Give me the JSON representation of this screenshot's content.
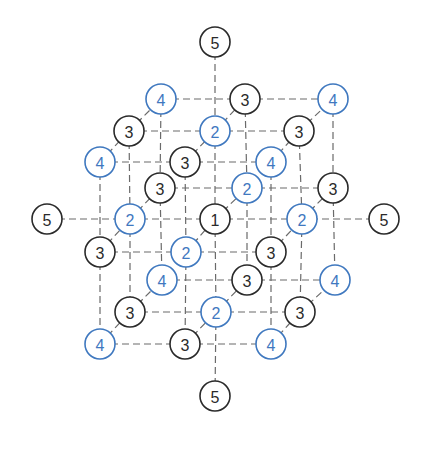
{
  "diagram": {
    "title": "",
    "colors": {
      "odd_shell": "#2a2a2a",
      "even_shell": "#3f78bf",
      "edge": "#6a6a6a",
      "background": "#ffffff"
    },
    "node_radius": 15,
    "nodes": [
      {
        "id": "top-5",
        "label": "5",
        "x": 215,
        "y": 42,
        "color": "odd"
      },
      {
        "id": "L2-r0-c0",
        "label": "4",
        "x": 161,
        "y": 99,
        "color": "even"
      },
      {
        "id": "L2-r0-c1",
        "label": "3",
        "x": 245,
        "y": 99,
        "color": "odd"
      },
      {
        "id": "L2-r0-c2",
        "label": "4",
        "x": 333,
        "y": 99,
        "color": "even"
      },
      {
        "id": "L1-r0-c0",
        "label": "3",
        "x": 129,
        "y": 131,
        "color": "odd"
      },
      {
        "id": "L1-r0-c1",
        "label": "2",
        "x": 215,
        "y": 131,
        "color": "even"
      },
      {
        "id": "L1-r0-c2",
        "label": "3",
        "x": 299,
        "y": 131,
        "color": "odd"
      },
      {
        "id": "L0-r0-c0",
        "label": "4",
        "x": 100,
        "y": 162,
        "color": "even"
      },
      {
        "id": "L0-r0-c1",
        "label": "3",
        "x": 185,
        "y": 162,
        "color": "odd"
      },
      {
        "id": "L0-r0-c2",
        "label": "4",
        "x": 271,
        "y": 162,
        "color": "even"
      },
      {
        "id": "L2-r1-c0",
        "label": "3",
        "x": 160,
        "y": 188,
        "color": "odd"
      },
      {
        "id": "L2-r1-c1",
        "label": "2",
        "x": 247,
        "y": 188,
        "color": "even"
      },
      {
        "id": "L2-r1-c2",
        "label": "3",
        "x": 333,
        "y": 188,
        "color": "odd"
      },
      {
        "id": "left-5",
        "label": "5",
        "x": 47,
        "y": 219,
        "color": "odd"
      },
      {
        "id": "L1-r1-c0",
        "label": "2",
        "x": 130,
        "y": 219,
        "color": "even"
      },
      {
        "id": "center-1",
        "label": "1",
        "x": 215,
        "y": 219,
        "color": "odd"
      },
      {
        "id": "L1-r1-c2",
        "label": "2",
        "x": 302,
        "y": 219,
        "color": "even"
      },
      {
        "id": "right-5",
        "label": "5",
        "x": 384,
        "y": 219,
        "color": "odd"
      },
      {
        "id": "L0-r1-c0",
        "label": "3",
        "x": 100,
        "y": 252,
        "color": "odd"
      },
      {
        "id": "L0-r1-c1",
        "label": "2",
        "x": 186,
        "y": 252,
        "color": "even"
      },
      {
        "id": "L0-r1-c2",
        "label": "3",
        "x": 271,
        "y": 252,
        "color": "odd"
      },
      {
        "id": "L2-r2-c0",
        "label": "4",
        "x": 162,
        "y": 280,
        "color": "even"
      },
      {
        "id": "L2-r2-c1",
        "label": "3",
        "x": 247,
        "y": 280,
        "color": "odd"
      },
      {
        "id": "L2-r2-c2",
        "label": "4",
        "x": 335,
        "y": 280,
        "color": "even"
      },
      {
        "id": "L1-r2-c0",
        "label": "3",
        "x": 130,
        "y": 312,
        "color": "odd"
      },
      {
        "id": "L1-r2-c1",
        "label": "2",
        "x": 216,
        "y": 312,
        "color": "even"
      },
      {
        "id": "L1-r2-c2",
        "label": "3",
        "x": 300,
        "y": 312,
        "color": "odd"
      },
      {
        "id": "L0-r2-c0",
        "label": "4",
        "x": 100,
        "y": 344,
        "color": "even"
      },
      {
        "id": "L0-r2-c1",
        "label": "3",
        "x": 185,
        "y": 344,
        "color": "odd"
      },
      {
        "id": "L0-r2-c2",
        "label": "4",
        "x": 271,
        "y": 344,
        "color": "even"
      },
      {
        "id": "bottom-5",
        "label": "5",
        "x": 215,
        "y": 396,
        "color": "odd"
      }
    ],
    "edges": [
      [
        "L2-r0-c0",
        "L2-r0-c1"
      ],
      [
        "L2-r0-c1",
        "L2-r0-c2"
      ],
      [
        "L2-r1-c0",
        "L2-r1-c1"
      ],
      [
        "L2-r1-c1",
        "L2-r1-c2"
      ],
      [
        "L2-r2-c0",
        "L2-r2-c1"
      ],
      [
        "L2-r2-c1",
        "L2-r2-c2"
      ],
      [
        "L1-r0-c0",
        "L1-r0-c1"
      ],
      [
        "L1-r0-c1",
        "L1-r0-c2"
      ],
      [
        "L1-r1-c0",
        "center-1"
      ],
      [
        "center-1",
        "L1-r1-c2"
      ],
      [
        "L1-r2-c0",
        "L1-r2-c1"
      ],
      [
        "L1-r2-c1",
        "L1-r2-c2"
      ],
      [
        "L0-r0-c0",
        "L0-r0-c1"
      ],
      [
        "L0-r0-c1",
        "L0-r0-c2"
      ],
      [
        "L0-r1-c0",
        "L0-r1-c1"
      ],
      [
        "L0-r1-c1",
        "L0-r1-c2"
      ],
      [
        "L0-r2-c0",
        "L0-r2-c1"
      ],
      [
        "L0-r2-c1",
        "L0-r2-c2"
      ],
      [
        "L2-r0-c0",
        "L2-r1-c0"
      ],
      [
        "L2-r1-c0",
        "L2-r2-c0"
      ],
      [
        "L2-r0-c1",
        "L2-r1-c1"
      ],
      [
        "L2-r1-c1",
        "L2-r2-c1"
      ],
      [
        "L2-r0-c2",
        "L2-r1-c2"
      ],
      [
        "L2-r1-c2",
        "L2-r2-c2"
      ],
      [
        "L1-r0-c0",
        "L1-r1-c0"
      ],
      [
        "L1-r1-c0",
        "L1-r2-c0"
      ],
      [
        "L1-r0-c1",
        "center-1"
      ],
      [
        "center-1",
        "L1-r2-c1"
      ],
      [
        "L1-r0-c2",
        "L1-r1-c2"
      ],
      [
        "L1-r1-c2",
        "L1-r2-c2"
      ],
      [
        "L0-r0-c0",
        "L0-r1-c0"
      ],
      [
        "L0-r1-c0",
        "L0-r2-c0"
      ],
      [
        "L0-r0-c1",
        "L0-r1-c1"
      ],
      [
        "L0-r1-c1",
        "L0-r2-c1"
      ],
      [
        "L0-r0-c2",
        "L0-r1-c2"
      ],
      [
        "L0-r1-c2",
        "L0-r2-c2"
      ],
      [
        "L0-r0-c0",
        "L1-r0-c0"
      ],
      [
        "L1-r0-c0",
        "L2-r0-c0"
      ],
      [
        "L0-r0-c1",
        "L1-r0-c1"
      ],
      [
        "L1-r0-c1",
        "L2-r0-c1"
      ],
      [
        "L0-r0-c2",
        "L1-r0-c2"
      ],
      [
        "L1-r0-c2",
        "L2-r0-c2"
      ],
      [
        "L0-r1-c0",
        "L1-r1-c0"
      ],
      [
        "L1-r1-c0",
        "L2-r1-c0"
      ],
      [
        "L0-r1-c1",
        "center-1"
      ],
      [
        "center-1",
        "L2-r1-c1"
      ],
      [
        "L0-r1-c2",
        "L1-r1-c2"
      ],
      [
        "L1-r1-c2",
        "L2-r1-c2"
      ],
      [
        "L0-r2-c0",
        "L1-r2-c0"
      ],
      [
        "L1-r2-c0",
        "L2-r2-c0"
      ],
      [
        "L0-r2-c1",
        "L1-r2-c1"
      ],
      [
        "L1-r2-c1",
        "L2-r2-c1"
      ],
      [
        "L0-r2-c2",
        "L1-r2-c2"
      ],
      [
        "L1-r2-c2",
        "L2-r2-c2"
      ],
      [
        "top-5",
        "L1-r0-c1"
      ],
      [
        "bottom-5",
        "L1-r2-c1"
      ],
      [
        "left-5",
        "L1-r1-c0"
      ],
      [
        "right-5",
        "L1-r1-c2"
      ]
    ]
  }
}
